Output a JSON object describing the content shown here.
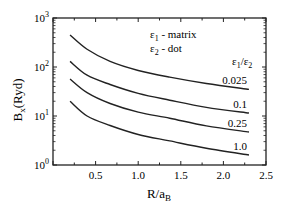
{
  "chart_data": {
    "type": "line",
    "title": "",
    "xlabel": "R/a_B",
    "ylabel": "B_x(Ryd)",
    "x_scale": "linear",
    "y_scale": "log",
    "xlim": [
      0,
      2.5
    ],
    "ylim": [
      1,
      1000
    ],
    "x_ticks": [
      "0.5",
      "1.0",
      "1.5",
      "2.0",
      "2.5"
    ],
    "y_ticks": [
      "10^0",
      "10^1",
      "10^2",
      "10^3"
    ],
    "grid": false,
    "legend_notes": [
      "ε1 - matrix",
      "ε2 - dot"
    ],
    "series_header": "ε1/ε2",
    "x": [
      0.2,
      0.4,
      0.67,
      1.0,
      1.37,
      1.8,
      2.3
    ],
    "series": [
      {
        "name": "0.025",
        "values": [
          450,
          230,
          130,
          85,
          62,
          46,
          35
        ]
      },
      {
        "name": "0.1",
        "values": [
          130,
          68,
          44,
          29,
          21,
          15,
          11.5
        ]
      },
      {
        "name": "0.25",
        "values": [
          57,
          30,
          18,
          12,
          9,
          6.3,
          4.7
        ]
      },
      {
        "name": "1.0",
        "values": [
          20,
          10,
          6.4,
          4.2,
          3.1,
          2.2,
          1.6
        ]
      }
    ]
  }
}
